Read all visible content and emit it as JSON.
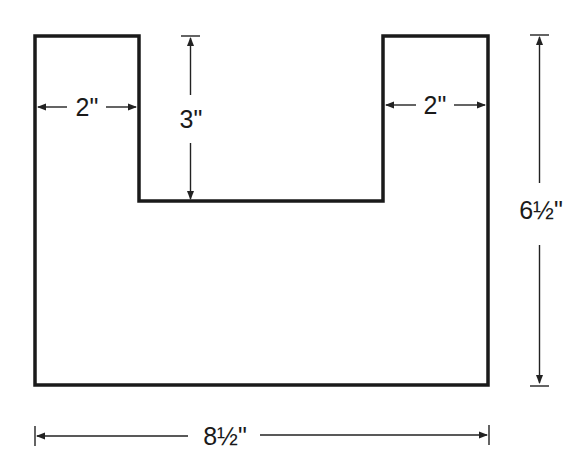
{
  "diagram": {
    "shape": "U-shaped board outline",
    "dimensions": {
      "left_arm_width": "2\"",
      "right_arm_width": "2\"",
      "notch_depth": "3\"",
      "total_height": "6½\"",
      "total_width": "8½\""
    }
  }
}
